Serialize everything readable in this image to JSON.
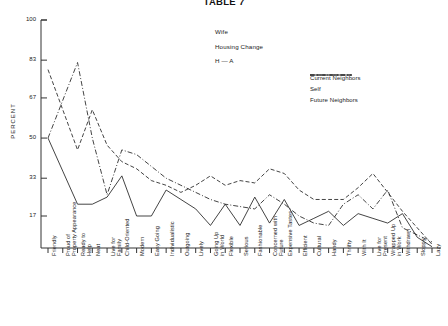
{
  "title": "TABLE 7",
  "annotation": {
    "line1": "Wife",
    "line2": "Housing Change",
    "line3": "H — A"
  },
  "legend": {
    "position": "top-right",
    "entries": [
      {
        "label": "Current Neighbors",
        "style": "dash-dot",
        "color": "#222222"
      },
      {
        "label": "Self",
        "style": "dashed",
        "color": "#222222"
      },
      {
        "label": "Future Neighbors",
        "style": "solid",
        "color": "#222222"
      }
    ]
  },
  "axes": {
    "ylabel": "PERCENT",
    "yticks": [
      100,
      83,
      67,
      50,
      33,
      17
    ],
    "ylim": [
      0,
      100
    ],
    "xlabel": ""
  },
  "chart_data": {
    "type": "line",
    "title": "TABLE 7",
    "xlabel": "",
    "ylabel": "PERCENT",
    "ylim": [
      0,
      100
    ],
    "yticks": [
      100,
      83,
      67,
      50,
      33,
      17
    ],
    "grid": false,
    "legend_position": "top-right",
    "annotations": [
      "Wife",
      "Housing Change",
      "H — A"
    ],
    "categories": [
      "Friendly",
      "Proud of Property Appearance",
      "Ready to Help",
      "Neat",
      "Live for Family",
      "Child-Oriented",
      "Modern",
      "Easy Going",
      "Individualistic",
      "Outgoing",
      "Lively",
      "Going Up in World",
      "Flexible",
      "Serious",
      "Fashionable",
      "Concerned with Future",
      "Expensive Tastes",
      "Efficient",
      "Cultural",
      "Handy",
      "Thrifty",
      "With It",
      "Live for Present",
      "Wrapped Up in Work",
      "Withdrawn",
      "Sloppy",
      "Lazy"
    ],
    "series": [
      {
        "name": "Current Neighbors",
        "style": "dash-dot",
        "values": [
          50,
          66,
          82,
          50,
          26,
          45,
          43,
          38,
          33,
          30,
          27,
          24,
          22,
          21,
          20,
          26,
          22,
          17,
          14,
          13,
          22,
          26,
          20,
          28,
          12,
          9,
          6
        ]
      },
      {
        "name": "Self",
        "style": "dashed",
        "values": [
          79,
          62,
          45,
          62,
          47,
          40,
          37,
          32,
          30,
          27,
          30,
          34,
          30,
          32,
          31,
          37,
          35,
          28,
          24,
          24,
          24,
          29,
          35,
          27,
          19,
          12,
          5
        ]
      },
      {
        "name": "Future Neighbors",
        "style": "solid",
        "values": [
          50,
          36,
          22,
          22,
          25,
          34,
          17,
          17,
          28,
          24,
          20,
          13,
          22,
          13,
          25,
          14,
          24,
          13,
          16,
          19,
          13,
          18,
          16,
          14,
          18,
          8,
          4
        ]
      }
    ]
  }
}
